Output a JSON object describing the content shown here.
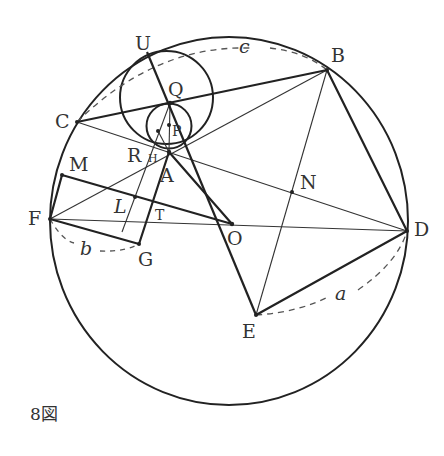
{
  "figure": {
    "caption": "8図",
    "points": {
      "U": "U",
      "Q": "Q",
      "P": "P",
      "C": "C",
      "B": "B",
      "R": "R",
      "H": "H",
      "A": "A",
      "M": "M",
      "N": "N",
      "F": "F",
      "L": "L",
      "T": "T",
      "O": "O",
      "D": "D",
      "G": "G",
      "E": "E"
    },
    "arc_labels": {
      "a": "a",
      "b": "b",
      "c": "c"
    },
    "colors": {
      "stroke": "#222222",
      "dashed": "#555555",
      "text": "#333333"
    }
  }
}
